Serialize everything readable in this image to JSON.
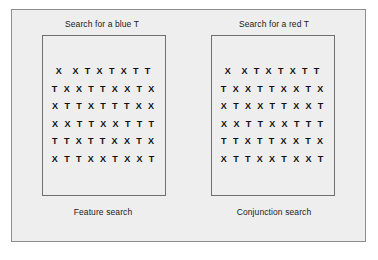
{
  "figure": {
    "background_color": "#eeeeee",
    "border_color": "#8d8d8d"
  },
  "panels": [
    {
      "header": "Search for a blue T",
      "caption": "Feature search",
      "rows": [
        "X  X T X T X T T",
        "T X X T T X X T X",
        "X T T X T T T X X",
        "X X T T X X T T T",
        "T T X T T X X T X",
        "X T T X X T X X T"
      ]
    },
    {
      "header": "Search for a red T",
      "caption": "Conjunction search",
      "rows": [
        "X  X T X T X T T",
        "T X X T T X X T X",
        "X T X X T T X X T",
        "X X T T X X T T T",
        "T T X T T X X T X",
        "X T T X X T X X T"
      ]
    }
  ]
}
